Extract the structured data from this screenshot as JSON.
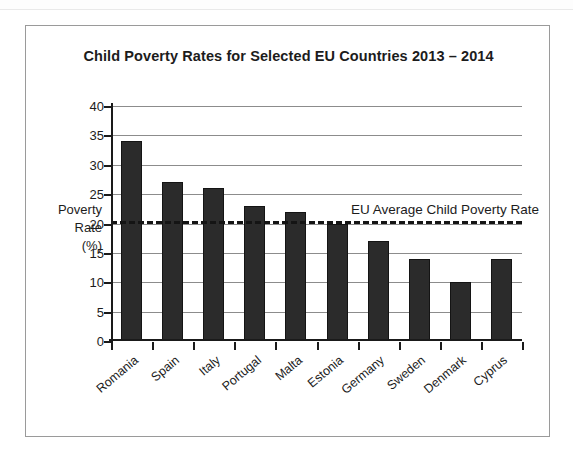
{
  "chart_data": {
    "type": "bar",
    "title": "Child Poverty Rates for Selected EU Countries 2013 – 2014",
    "xlabel": "",
    "ylabel": "Poverty Rate (%)",
    "ylabel_lines": [
      "Poverty",
      "Rate",
      "(%)"
    ],
    "categories": [
      "Romania",
      "Spain",
      "Italy",
      "Portugal",
      "Malta",
      "Estonia",
      "Germany",
      "Sweden",
      "Denmark",
      "Cyprus"
    ],
    "values": [
      34,
      27,
      26,
      23,
      22,
      20,
      17,
      14,
      10,
      14
    ],
    "ylim": [
      0,
      40
    ],
    "ytick_step": 5,
    "yticks": [
      0,
      5,
      10,
      15,
      20,
      25,
      30,
      35,
      40
    ],
    "ytick_labels": [
      "0",
      "5",
      "10",
      "15",
      "20",
      "25",
      "30",
      "35",
      "40"
    ],
    "grid": "horizontal",
    "legend": "none",
    "bar_color": "#2b2b2b",
    "gridline_color": "#8c8c8c",
    "axis_color": "#1a1a1a",
    "annotations": [
      {
        "name": "eu-average-line",
        "label": "EU Average Child Poverty Rate",
        "value": 20.5,
        "style": "dashed",
        "color": "#141414"
      }
    ]
  }
}
